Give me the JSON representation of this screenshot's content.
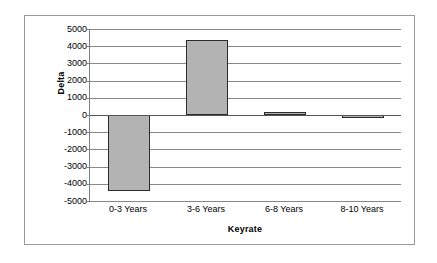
{
  "chart_data": {
    "type": "bar",
    "title": "",
    "xlabel": "Keyrate",
    "ylabel": "Delta",
    "categories": [
      "0-3 Years",
      "3-6 Years",
      "6-8 Years",
      "8-10 Years"
    ],
    "values": [
      -4400,
      4350,
      150,
      -200
    ],
    "series": [
      {
        "name": "Delta",
        "values": [
          -4400,
          4350,
          150,
          -200
        ]
      }
    ],
    "ylim": [
      -5000,
      5000
    ],
    "y_ticks": [
      5000,
      4000,
      3000,
      2000,
      1000,
      0,
      -1000,
      -2000,
      -3000,
      -4000,
      -5000
    ],
    "y_tick_labels": [
      "5000",
      "4000",
      "3000",
      "2000",
      "1000",
      "0",
      "-1000",
      "-2000",
      "-3000",
      "-4000",
      "-5000"
    ],
    "grid": true,
    "grid_axis": "y",
    "legend": false,
    "legend_position": "none",
    "bar_fill_color": "#b3b3b3",
    "bar_border_color": "#2b2b2b",
    "plot_background_color": "#ffffff",
    "gridline_color": "#888888",
    "axis_line_color": "#808080",
    "frame_border_color": "#999999"
  }
}
